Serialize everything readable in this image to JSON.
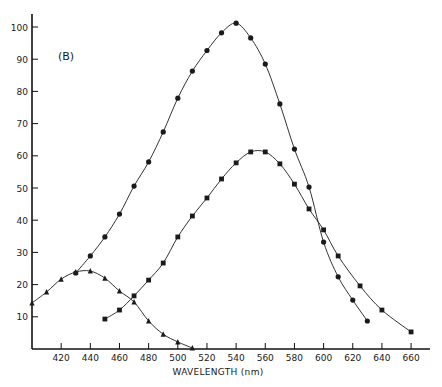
{
  "chart_data": {
    "type": "line",
    "title": "",
    "panel_label": "(B)",
    "xlabel": "WAVELENGTH (nm)",
    "ylabel": "",
    "xlim": [
      400,
      673
    ],
    "ylim": [
      0,
      105
    ],
    "x_ticks": [
      420,
      440,
      460,
      480,
      500,
      520,
      540,
      560,
      580,
      600,
      620,
      640,
      660
    ],
    "y_ticks": [
      10,
      20,
      30,
      40,
      50,
      60,
      70,
      80,
      90,
      100
    ],
    "grid": false,
    "legend": "none",
    "series": [
      {
        "name": "circles",
        "marker": "circle",
        "x": [
          430,
          440,
          450,
          460,
          470,
          480,
          490,
          500,
          510,
          520,
          530,
          540,
          550,
          560,
          570,
          580,
          590,
          600,
          610,
          620,
          630
        ],
        "y": [
          23.6,
          28.9,
          34.8,
          41.9,
          50.6,
          58.1,
          67.4,
          77.9,
          86.3,
          92.7,
          98.2,
          101.2,
          96.6,
          88.5,
          76.1,
          62.1,
          50.3,
          33.2,
          22.4,
          15.2,
          8.7
        ]
      },
      {
        "name": "squares",
        "marker": "square",
        "x": [
          450,
          460,
          470,
          480,
          490,
          500,
          510,
          520,
          530,
          540,
          550,
          560,
          570,
          580,
          590,
          600,
          610,
          625,
          640,
          660
        ],
        "y": [
          9.3,
          12.1,
          16.5,
          21.4,
          26.7,
          34.8,
          41.3,
          46.9,
          52.8,
          57.8,
          61.2,
          61.2,
          57.5,
          51.2,
          43.5,
          37.0,
          28.9,
          19.6,
          12.1,
          5.3
        ]
      },
      {
        "name": "triangles",
        "marker": "triangle",
        "x": [
          400,
          410,
          420,
          430,
          440,
          450,
          460,
          470,
          480,
          490,
          500,
          510
        ],
        "y": [
          14.3,
          17.7,
          21.7,
          23.9,
          24.2,
          22.0,
          18.0,
          14.6,
          8.7,
          4.6,
          2.2,
          0.3
        ]
      }
    ]
  }
}
